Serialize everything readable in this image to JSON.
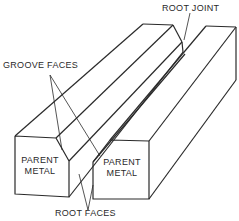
{
  "diagram": {
    "type": "square-groove butt joint illustration",
    "labels": {
      "root_joint": "ROOT JOINT",
      "groove_faces": "GROOVE FACES",
      "root_faces": "ROOT FACES",
      "left_part_line1": "PARENT",
      "left_part_line2": "METAL",
      "right_part_line1": "PARENT",
      "right_part_line2": "METAL"
    },
    "colors": {
      "line": "#2a2a2a",
      "background": "#ffffff"
    }
  }
}
